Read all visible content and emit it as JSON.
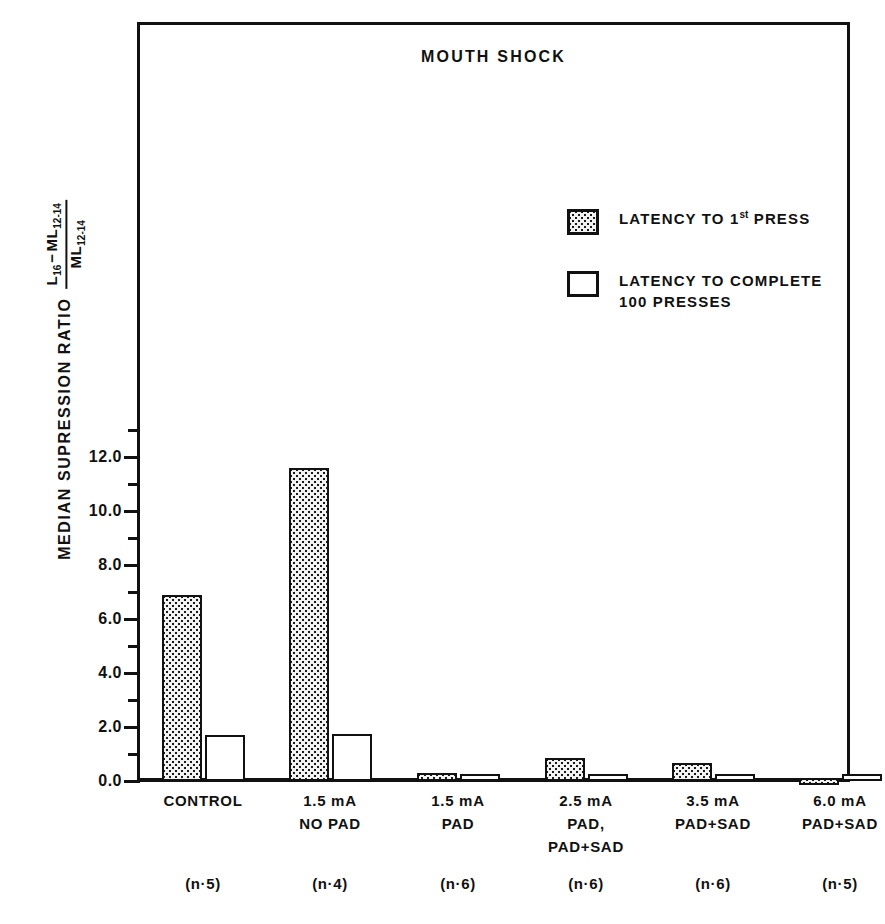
{
  "chart_data": {
    "type": "bar",
    "title": "MOUTH SHOCK",
    "xlabel": "",
    "ylabel": "MEDIAN SUPRESSION RATIO",
    "ylabel_formula_numerator": "L16 − ML12-14",
    "ylabel_formula_denominator": "ML12-14",
    "ylim": [
      -0.2,
      13.8
    ],
    "ytick_labels": [
      "0.0",
      "2.0",
      "4.0",
      "6.0",
      "8.0",
      "10.0",
      "12.0"
    ],
    "ytick_values": [
      0.0,
      2.0,
      4.0,
      6.0,
      8.0,
      10.0,
      12.0
    ],
    "yminor_values": [
      1.0,
      3.0,
      5.0,
      7.0,
      9.0,
      11.0,
      13.0
    ],
    "grid": false,
    "legend_position": "upper right",
    "categories": [
      "CONTROL",
      "1.5 mA\nNO PAD",
      "1.5 mA\nPAD",
      "2.5 mA\nPAD,\nPAD+SAD",
      "3.5 mA\nPAD+SAD",
      "6.0 mA\nPAD+SAD"
    ],
    "group_sizes": [
      "(n·5)",
      "(n·4)",
      "(n·6)",
      "(n·6)",
      "(n·6)",
      "(n·5)"
    ],
    "series": [
      {
        "name": "LATENCY TO 1st PRESS",
        "fill": "stippled",
        "values": [
          6.9,
          11.6,
          0.3,
          0.85,
          0.65,
          -0.08
        ]
      },
      {
        "name": "LATENCY TO COMPLETE 100 PRESSES",
        "fill": "open",
        "values": [
          1.7,
          1.73,
          0.15,
          0.14,
          0.11,
          0.1
        ]
      }
    ]
  },
  "legend": {
    "entries": [
      {
        "label_pre": "LATENCY TO 1",
        "label_sup": "st",
        "label_post": " PRESS",
        "swatch": "stippled"
      },
      {
        "label": "LATENCY TO COMPLETE\n100 PRESSES",
        "swatch": "open"
      }
    ]
  },
  "colors": {
    "ink": "#111111",
    "background": "#ffffff",
    "stipple_fill": "#f2f2f2",
    "open_fill": "#ffffff"
  }
}
